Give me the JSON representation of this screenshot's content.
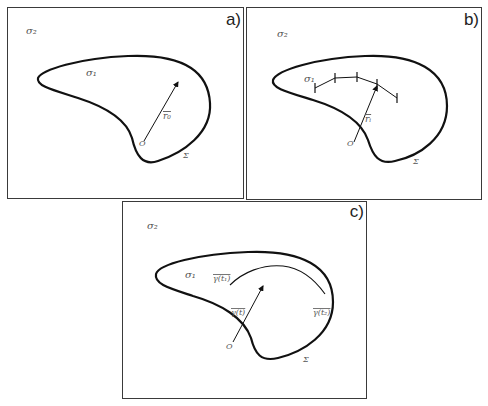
{
  "figure": {
    "panels": [
      {
        "id": "a",
        "letter": "a)",
        "outer_region_label": "σ₂",
        "inner_region_label": "σ₁",
        "boundary_label": "Σ",
        "origin_label": "O",
        "vector_label": "r₀"
      },
      {
        "id": "b",
        "letter": "b)",
        "outer_region_label": "σ₂",
        "inner_region_label": "σ₁",
        "boundary_label": "Σ",
        "origin_label": "O",
        "vector_label": "rᵢ"
      },
      {
        "id": "c",
        "letter": "c)",
        "outer_region_label": "σ₂",
        "inner_region_label": "σ₁",
        "boundary_label": "Σ",
        "origin_label": "O",
        "vector_label": "γ(t)",
        "curve_start_label": "γ(t₁)",
        "curve_end_label": "γ(t₂)"
      }
    ],
    "colors": {
      "stroke": "#111111",
      "border": "#3a3a3a",
      "label": "#555555"
    }
  }
}
